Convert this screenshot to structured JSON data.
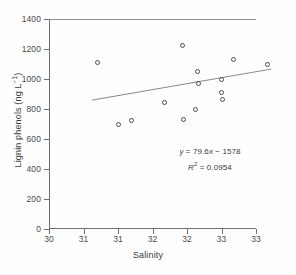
{
  "chart_data": {
    "type": "scatter",
    "title": "",
    "xlabel": "Salinity",
    "ylabel": "Lignin phenols (ng L-1)",
    "ylabel_main": "Lignin phenols (ng L",
    "ylabel_sup": "−1",
    "ylabel_tail": ")",
    "xlim": [
      30,
      33
    ],
    "ylim": [
      0,
      1400
    ],
    "grid": false,
    "legend": null,
    "xticks": [
      30,
      30.5,
      31,
      31.5,
      32,
      32.5,
      33
    ],
    "xtick_labels": [
      "30",
      "31",
      "31",
      "32",
      "32",
      "33",
      "33"
    ],
    "yticks": [
      0,
      200,
      400,
      600,
      800,
      1000,
      1200,
      1400
    ],
    "ytick_labels": [
      "0",
      "200",
      "400",
      "600",
      "800",
      "1000",
      "1200",
      "1400"
    ],
    "marker": "open-circle",
    "marker_color": "#4d4d4d",
    "line_color": "#7a7a7a",
    "points": [
      {
        "x": 30.7,
        "y": 1110
      },
      {
        "x": 31.0,
        "y": 697
      },
      {
        "x": 31.2,
        "y": 723
      },
      {
        "x": 31.68,
        "y": 845
      },
      {
        "x": 31.93,
        "y": 1222
      },
      {
        "x": 31.95,
        "y": 730
      },
      {
        "x": 32.13,
        "y": 798
      },
      {
        "x": 32.5,
        "y": 908
      },
      {
        "x": 32.68,
        "y": 1128
      },
      {
        "x": 32.15,
        "y": 1050
      },
      {
        "x": 32.17,
        "y": 968
      },
      {
        "x": 32.5,
        "y": 995
      },
      {
        "x": 32.52,
        "y": 865
      },
      {
        "x": 33.17,
        "y": 1098
      }
    ],
    "trendline": {
      "type": "linear",
      "slope": 79.6,
      "intercept": -1578,
      "x_start": 30.62,
      "x_end": 33.22,
      "y_start": 859,
      "y_end": 1066
    },
    "annotations": {
      "equation": "y = 79.6x − 1578",
      "equation_y": "y",
      "equation_body": " = 79.6",
      "equation_x": "x",
      "equation_rest": " − 1578",
      "r_squared_label": "R",
      "r_squared_sup": "2",
      "r_squared_value": " = 0.0954",
      "r_squared": "R2 = 0.0954"
    }
  },
  "figure": {
    "background": "#ffffff",
    "axis_color": "#6f6f6f",
    "text_color": "#3a3a3a"
  }
}
